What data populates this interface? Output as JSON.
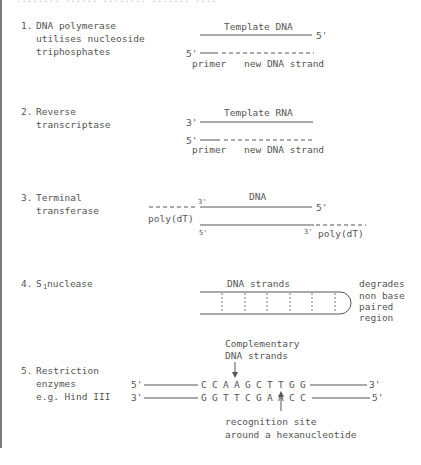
{
  "header": {
    "faded_caption": "........ ...... ........ ....... ...."
  },
  "items": [
    {
      "number": "1.",
      "label_lines": [
        "DNA polymerase",
        "utilises nucleoside",
        "triphosphates"
      ],
      "diagram": {
        "top_label": "Template DNA",
        "top_end": "5'",
        "bottom_start": "5'",
        "caption_primer": "primer",
        "caption_new": "new DNA strand"
      }
    },
    {
      "number": "2.",
      "label_lines": [
        "Reverse",
        "transcriptase"
      ],
      "diagram": {
        "top_label": "Template RNA",
        "top_start": "3'",
        "bottom_start": "5'",
        "caption_primer": "primer",
        "caption_new": "new DNA strand"
      }
    },
    {
      "number": "3.",
      "label_lines": [
        "Terminal",
        "transferase"
      ],
      "diagram": {
        "top_label": "DNA",
        "top_left_end": "3'",
        "top_right_end": "5'",
        "bottom_left_end": "5'",
        "bottom_right_end": "3'",
        "left_tail": "poly(dT)",
        "right_tail": "poly(dT)"
      }
    },
    {
      "number": "4.",
      "label_main": "S",
      "label_sub": "1",
      "label_rest": " nuclease",
      "diagram": {
        "top_label": "DNA strands",
        "side_note_lines": [
          "degrades",
          "non base",
          "paired",
          "region"
        ]
      }
    },
    {
      "number": "5.",
      "label_lines": [
        "Restriction",
        "enzymes",
        "e.g. Hind III"
      ],
      "diagram": {
        "top_note_lines": [
          "Complementary",
          "DNA strands"
        ],
        "top_strand": {
          "start": "5'",
          "sequence": [
            "C",
            "C",
            "A",
            "A",
            "G",
            "C",
            "T",
            "T",
            "G",
            "G"
          ],
          "end": "3'"
        },
        "bottom_strand": {
          "start": "3'",
          "sequence": [
            "G",
            "G",
            "T",
            "T",
            "C",
            "G",
            "A",
            "A",
            "C",
            "C"
          ],
          "end": "5'"
        },
        "bottom_note_lines": [
          "recognition site",
          "around a hexanucleotide"
        ]
      }
    }
  ],
  "colors": {
    "ink": "#555555",
    "border": "#7a7a7a",
    "background": "#ffffff"
  }
}
